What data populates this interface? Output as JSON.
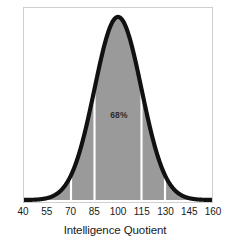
{
  "chart_data": {
    "type": "area",
    "title": "",
    "subtitle": "",
    "xlabel": "Intelligence Quotient",
    "ylabel": "Proportion of Population",
    "xlim": [
      40,
      160
    ],
    "ylim": [
      0,
      1
    ],
    "grid": false,
    "legend": null,
    "distribution": {
      "kind": "normal",
      "mean": 100,
      "sd": 15
    },
    "xticks": [
      40,
      55,
      70,
      85,
      100,
      115,
      130,
      145,
      160
    ],
    "xticklabels": [
      "40",
      "55",
      "70",
      "85",
      "100",
      "115",
      "130",
      "145",
      "160"
    ],
    "yticks": [],
    "yticklabels": [],
    "band_dividers": [
      55,
      70,
      85,
      115,
      130,
      145
    ],
    "annotations": [
      {
        "text": "68%",
        "x": 100,
        "y": 0.47,
        "name": "sixty-eight-percent-label"
      }
    ],
    "x": [
      40,
      45,
      50,
      55,
      60,
      65,
      70,
      75,
      80,
      85,
      90,
      95,
      100,
      105,
      110,
      115,
      120,
      125,
      130,
      135,
      140,
      145,
      150,
      155,
      160
    ],
    "values": [
      0.0,
      0.001,
      0.004,
      0.011,
      0.029,
      0.065,
      0.135,
      0.25,
      0.411,
      0.607,
      0.801,
      0.946,
      1.0,
      0.946,
      0.801,
      0.607,
      0.411,
      0.25,
      0.135,
      0.065,
      0.029,
      0.011,
      0.004,
      0.001,
      0.0
    ],
    "series": [
      {
        "name": "Proportion of Population",
        "values": [
          0.0,
          0.001,
          0.004,
          0.011,
          0.029,
          0.065,
          0.135,
          0.25,
          0.411,
          0.607,
          0.801,
          0.946,
          1.0,
          0.946,
          0.801,
          0.607,
          0.411,
          0.25,
          0.135,
          0.065,
          0.029,
          0.011,
          0.004,
          0.001,
          0.0
        ]
      }
    ],
    "colors": {
      "curve": "#111111",
      "fill": "#9a9a9a",
      "divider": "#ffffff",
      "frame": "#cfcfcf",
      "text": "#1a1a1a",
      "background": "#ffffff"
    }
  }
}
